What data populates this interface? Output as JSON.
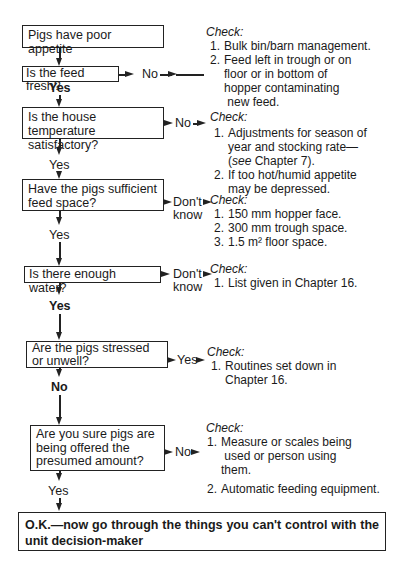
{
  "flowchart": {
    "start": "Pigs have poor appetite",
    "questions": [
      {
        "id": "q1",
        "text": "Is the feed fresh?",
        "branch_label": "No",
        "continue_label": "Yes",
        "check_title": "Check:",
        "check_items": [
          "Bulk bin/barn management.",
          "Feed left in trough or on floor or in bottom of hopper contaminating new feed."
        ]
      },
      {
        "id": "q2",
        "text": "Is the house temperature satisfactory?",
        "branch_label": "No",
        "continue_label": "Yes",
        "check_title": "Check:",
        "check_items": [
          "Adjustments for season of year and stocking rate— (see Chapter 7).",
          "If too hot/humid appetite may be depressed."
        ]
      },
      {
        "id": "q3",
        "text": "Have the pigs sufficient feed space?",
        "branch_label": "Don't know",
        "continue_label": "Yes",
        "check_title": "Check:",
        "check_items": [
          "150 mm hopper face.",
          "300 mm trough space.",
          "1.5 m² floor space."
        ]
      },
      {
        "id": "q4",
        "text": "Is there enough water?",
        "branch_label": "Don't know",
        "continue_label": "Yes",
        "check_title": "Check:",
        "check_items": [
          "List given in Chapter 16."
        ]
      },
      {
        "id": "q5",
        "text": "Are the pigs stressed or unwell?",
        "branch_label": "Yes",
        "continue_label": "No",
        "check_title": "Check:",
        "check_items": [
          "Routines set down in Chapter 16."
        ]
      },
      {
        "id": "q6",
        "text": "Are you sure pigs are being offered the presumed amount?",
        "branch_label": "No",
        "continue_label": "Yes",
        "check_title": "Check:",
        "check_items": [
          "Measure or scales being used or person using them.",
          "Automatic feeding equipment."
        ]
      }
    ],
    "end": "O.K.—now go through the things you can't control with the unit decision-maker"
  },
  "labels": {
    "q1_no": "No",
    "q1_yes": "Yes",
    "q2_no": "No",
    "q2_yes": "Yes",
    "q3_dont": "Don't",
    "q3_know": "know",
    "q3_yes": "Yes",
    "q4_dont": "Don't",
    "q4_know": "know",
    "q4_yes": "Yes",
    "q5_yes": "Yes",
    "q5_no": "No",
    "q6_no": "No",
    "q6_yes": "Yes",
    "q2_item1_a": "Adjustments for season of",
    "q2_item1_b": "year and stocking rate—",
    "q2_item1_see": "see",
    "q2_item1_c": " Chapter 7).",
    "q2_item1_open": "(",
    "q2_item2_a": "If too hot/humid appetite",
    "q2_item2_b": "may be depressed.",
    "q1_item2_a": "Feed left in trough or on",
    "q1_item2_b": "floor or in bottom of",
    "q1_item2_c": "hopper contaminating",
    "q1_item2_d": "new feed.",
    "q5_item1_a": "Routines set down in",
    "q5_item1_b": "Chapter 16.",
    "q6_item1_a": "Measure or scales being",
    "q6_item1_b": "used or person using",
    "q6_item1_c": "them.",
    "q2_box_a": "Is the house temperature",
    "q2_box_b": "satisfactory?",
    "q3_box_a": "Have the pigs sufficient",
    "q3_box_b": "feed space?",
    "q5_box_a": "Are the pigs stressed",
    "q5_box_b": "or unwell?",
    "q6_box_a": "Are you sure pigs are",
    "q6_box_b": "being offered the",
    "q6_box_c": "presumed amount?",
    "n1": "1.",
    "n2": "2.",
    "n3": "3."
  }
}
